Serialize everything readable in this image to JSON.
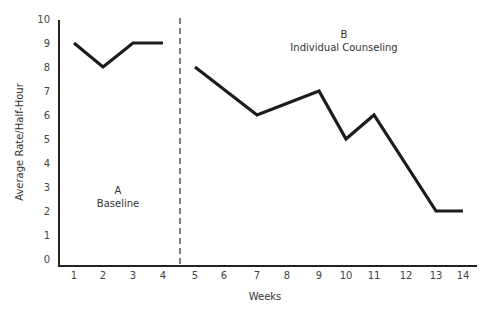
{
  "chart_data": {
    "type": "line",
    "title": "",
    "xlabel": "Weeks",
    "ylabel": "Average Rate/Half-Hour",
    "xlim": [
      1,
      14
    ],
    "ylim": [
      0,
      10
    ],
    "x_ticks": [
      1,
      2,
      3,
      4,
      5,
      6,
      7,
      8,
      9,
      10,
      11,
      12,
      13,
      14
    ],
    "y_ticks": [
      0,
      1,
      2,
      3,
      4,
      5,
      6,
      7,
      8,
      9,
      10
    ],
    "grid": false,
    "phase_divider_x": 4.5,
    "phases": [
      {
        "letter": "A",
        "name": "Baseline"
      },
      {
        "letter": "B",
        "name": "Individual Counseling"
      }
    ],
    "series": [
      {
        "name": "Baseline",
        "x": [
          1,
          2,
          3,
          4
        ],
        "values": [
          9,
          8,
          9,
          9
        ]
      },
      {
        "name": "Individual Counseling",
        "x": [
          5,
          7,
          9,
          10,
          11,
          13,
          14
        ],
        "values": [
          8,
          6,
          7,
          5,
          6,
          2,
          2
        ]
      }
    ]
  },
  "labels": {
    "xlabel": "Weeks",
    "ylabel": "Average Rate/Half-Hour",
    "phase_a_letter": "A",
    "phase_a_name": "Baseline",
    "phase_b_letter": "B",
    "phase_b_name": "Individual Counseling"
  }
}
